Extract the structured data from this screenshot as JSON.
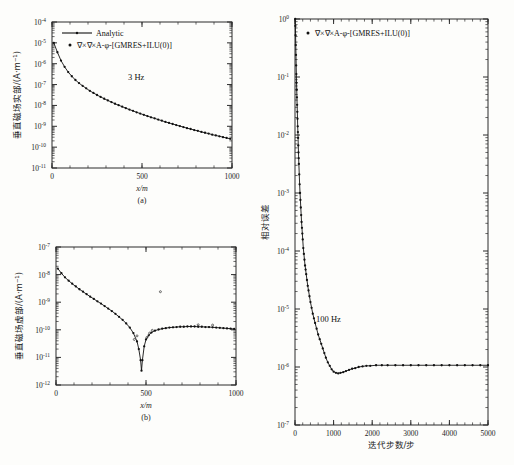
{
  "figure": {
    "panels": [
      "a",
      "b",
      "c"
    ]
  },
  "chart_data": [
    {
      "id": "panel-a",
      "type": "line",
      "panel_label": "(a)",
      "title": "",
      "annotation": "3 Hz",
      "xlabel": "x/m",
      "ylabel": "垂直磁场实部/(A·m⁻¹)",
      "xlim": [
        0,
        1000
      ],
      "ylim_exp": [
        -11,
        -4
      ],
      "xticks": [
        0,
        500,
        1000
      ],
      "xticklabels": [
        "0",
        "500",
        "1000"
      ],
      "yticks_exp": [
        -4,
        -5,
        -6,
        -7,
        -8,
        -9,
        -10,
        -11
      ],
      "yticklabels": [
        "10",
        "10",
        "10",
        "10",
        "10",
        "10",
        "10",
        "10"
      ],
      "ytickexps": [
        "-4",
        "-5",
        "-6",
        "-7",
        "-8",
        "-9",
        "-10",
        "-11"
      ],
      "grid": false,
      "legend_position": "top-center",
      "legend": [
        {
          "label": "Analytic",
          "style": "line"
        },
        {
          "label": "∇×∇×A-φ-[GMRES+ILU(0)]",
          "style": "marker"
        }
      ],
      "x": [
        10,
        30,
        50,
        70,
        90,
        110,
        130,
        150,
        170,
        190,
        210,
        230,
        250,
        270,
        290,
        310,
        330,
        350,
        370,
        390,
        410,
        430,
        450,
        470,
        490,
        510,
        530,
        550,
        570,
        590,
        610,
        630,
        650,
        670,
        690,
        710,
        730,
        750,
        770,
        790,
        810,
        830,
        850,
        870,
        890,
        910,
        930,
        950,
        970,
        990
      ],
      "y_exp": [
        -5.0,
        -5.45,
        -5.85,
        -6.15,
        -6.4,
        -6.6,
        -6.78,
        -6.93,
        -7.06,
        -7.18,
        -7.3,
        -7.4,
        -7.5,
        -7.59,
        -7.68,
        -7.76,
        -7.84,
        -7.92,
        -7.99,
        -8.06,
        -8.13,
        -8.2,
        -8.26,
        -8.33,
        -8.39,
        -8.45,
        -8.51,
        -8.57,
        -8.62,
        -8.68,
        -8.73,
        -8.79,
        -8.84,
        -8.89,
        -8.94,
        -8.99,
        -9.04,
        -9.09,
        -9.13,
        -9.18,
        -9.22,
        -9.27,
        -9.31,
        -9.35,
        -9.4,
        -9.44,
        -9.48,
        -9.52,
        -9.56,
        -9.6
      ]
    },
    {
      "id": "panel-b",
      "type": "line",
      "panel_label": "(b)",
      "title": "",
      "annotation": "",
      "xlabel": "x/m",
      "ylabel": "垂直磁场虚部/(A·m⁻¹)",
      "xlim": [
        0,
        1000
      ],
      "ylim_exp": [
        -12,
        -7
      ],
      "xticks": [
        0,
        500,
        1000
      ],
      "xticklabels": [
        "0",
        "500",
        "1000"
      ],
      "yticks_exp": [
        -7,
        -8,
        -9,
        -10,
        -11,
        -12
      ],
      "ytickexps": [
        "-7",
        "-8",
        "-9",
        "-10",
        "-11",
        "-12"
      ],
      "grid": false,
      "legend": [],
      "x": [
        10,
        30,
        50,
        70,
        90,
        110,
        130,
        150,
        170,
        190,
        210,
        230,
        250,
        270,
        290,
        310,
        330,
        350,
        370,
        390,
        410,
        430,
        450,
        460,
        470,
        475,
        480,
        490,
        500,
        515,
        530,
        550,
        570,
        590,
        610,
        630,
        650,
        670,
        690,
        710,
        730,
        750,
        770,
        790,
        810,
        830,
        850,
        870,
        890,
        910,
        930,
        950,
        970,
        990
      ],
      "y_exp": [
        -7.78,
        -7.95,
        -8.1,
        -8.22,
        -8.33,
        -8.43,
        -8.53,
        -8.62,
        -8.71,
        -8.8,
        -8.88,
        -8.97,
        -9.05,
        -9.14,
        -9.23,
        -9.32,
        -9.42,
        -9.53,
        -9.64,
        -9.77,
        -9.92,
        -10.12,
        -10.42,
        -10.7,
        -11.1,
        -11.48,
        -11.1,
        -10.6,
        -10.35,
        -10.2,
        -10.1,
        -10.03,
        -9.99,
        -9.96,
        -9.94,
        -9.92,
        -9.91,
        -9.9,
        -9.89,
        -9.89,
        -9.88,
        -9.88,
        -9.88,
        -9.89,
        -9.89,
        -9.9,
        -9.9,
        -9.91,
        -9.92,
        -9.93,
        -9.94,
        -9.95,
        -9.96,
        -9.97
      ],
      "outlier_points": [
        {
          "x": 435,
          "y_exp": -10.35
        },
        {
          "x": 450,
          "y_exp": -10.22
        },
        {
          "x": 505,
          "y_exp": -10.28
        },
        {
          "x": 520,
          "y_exp": -10.12
        },
        {
          "x": 535,
          "y_exp": -10.02
        },
        {
          "x": 580,
          "y_exp": -8.62
        },
        {
          "x": 790,
          "y_exp": -9.82
        },
        {
          "x": 870,
          "y_exp": -9.83
        }
      ]
    },
    {
      "id": "panel-c",
      "type": "line",
      "panel_label": "",
      "title": "",
      "annotation": "100 Hz",
      "xlabel": "迭代步数/步",
      "ylabel": "相对误差",
      "xlim": [
        0,
        5000
      ],
      "ylim_exp": [
        -7,
        0
      ],
      "xticks": [
        0,
        1000,
        2000,
        3000,
        4000,
        5000
      ],
      "xticklabels": [
        "0",
        "1000",
        "2000",
        "3000",
        "4000",
        "5000"
      ],
      "yticks_exp": [
        0,
        -1,
        -2,
        -3,
        -4,
        -5,
        -6,
        -7
      ],
      "ytickexps": [
        "0",
        "-1",
        "-2",
        "-3",
        "-4",
        "-5",
        "-6",
        "-7"
      ],
      "grid": false,
      "legend_position": "top-left-inside",
      "legend": [
        {
          "label": "∇×∇×A-φ-[GMRES+ILU(0)]",
          "style": "marker"
        }
      ],
      "x": [
        5,
        10,
        15,
        20,
        25,
        30,
        35,
        40,
        45,
        50,
        55,
        60,
        65,
        70,
        75,
        80,
        85,
        90,
        95,
        100,
        110,
        120,
        130,
        140,
        150,
        160,
        170,
        180,
        190,
        200,
        215,
        230,
        245,
        260,
        275,
        290,
        310,
        330,
        350,
        375,
        400,
        430,
        460,
        490,
        520,
        560,
        600,
        640,
        680,
        720,
        760,
        800,
        850,
        900,
        950,
        1000,
        1060,
        1120,
        1180,
        1250,
        1320,
        1400,
        1480,
        1560,
        1650,
        1750,
        1850,
        1950,
        2100,
        2250,
        2400,
        2600,
        2800,
        3000,
        3200,
        3400,
        3600,
        3800,
        4000,
        4200,
        4400,
        4600,
        4800,
        5000
      ],
      "y_exp": [
        0.0,
        -0.12,
        -0.28,
        -0.45,
        -0.62,
        -0.8,
        -0.95,
        -1.1,
        -1.22,
        -1.35,
        -1.48,
        -1.6,
        -1.72,
        -1.85,
        -1.95,
        -2.05,
        -2.18,
        -2.3,
        -2.4,
        -2.5,
        -2.68,
        -2.85,
        -3.0,
        -3.12,
        -3.25,
        -3.38,
        -3.5,
        -3.6,
        -3.7,
        -3.8,
        -3.95,
        -4.05,
        -4.15,
        -4.25,
        -4.32,
        -4.4,
        -4.5,
        -4.6,
        -4.68,
        -4.78,
        -4.88,
        -4.98,
        -5.08,
        -5.16,
        -5.24,
        -5.34,
        -5.44,
        -5.52,
        -5.6,
        -5.68,
        -5.76,
        -5.84,
        -5.92,
        -5.98,
        -6.04,
        -6.08,
        -6.1,
        -6.11,
        -6.1,
        -6.09,
        -6.07,
        -6.05,
        -6.03,
        -6.02,
        -6.0,
        -5.99,
        -5.98,
        -5.98,
        -5.97,
        -5.97,
        -5.97,
        -5.97,
        -5.97,
        -5.97,
        -5.97,
        -5.97,
        -5.97,
        -5.97,
        -5.97,
        -5.97,
        -5.97,
        -5.97,
        -5.97,
        -5.97
      ]
    }
  ]
}
